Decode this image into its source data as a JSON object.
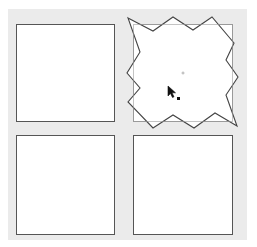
{
  "canvas": {
    "background_color": "#ebebeb",
    "cell_fill": "#ffffff",
    "cell_border_color": "#555555",
    "selected_cell_border_color": "#9a9a9a"
  },
  "grid": {
    "rows": 2,
    "columns": 2,
    "cells": [
      {
        "id": "top-left",
        "selected": false
      },
      {
        "id": "top-right",
        "selected": true,
        "distorted": true
      },
      {
        "id": "bottom-left",
        "selected": false
      },
      {
        "id": "bottom-right",
        "selected": false
      }
    ]
  },
  "distortion_shape": {
    "type": "zigzag-polygon",
    "stroke_color": "#444444",
    "fill_color": "#ffffff"
  },
  "icons": {
    "cursor": "arrow-cursor-icon",
    "center_marker": "center-point-icon"
  }
}
